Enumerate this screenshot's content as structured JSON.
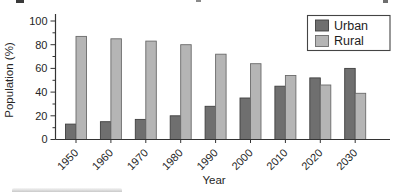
{
  "chart_data": {
    "type": "bar",
    "title": "",
    "categories": [
      "1950",
      "1960",
      "1970",
      "1980",
      "1990",
      "2000",
      "2010",
      "2020",
      "2030"
    ],
    "series": [
      {
        "name": "Urban",
        "values": [
          13,
          15,
          17,
          20,
          28,
          35,
          45,
          52,
          60
        ],
        "fill": "#6f6f6f",
        "stroke": "#3f3f3f"
      },
      {
        "name": "Rural",
        "values": [
          87,
          85,
          83,
          80,
          72,
          64,
          54,
          46,
          39
        ],
        "fill": "#b5b5b5",
        "stroke": "#6a6a6a"
      }
    ],
    "xlabel": "Year",
    "ylabel": "Population (%)",
    "ylim": [
      0,
      100
    ],
    "y_major_step": 20,
    "y_minor_step": 10,
    "y_tick_labels": [
      "0",
      "20",
      "40",
      "60",
      "80",
      "100"
    ],
    "grid": false,
    "legend": {
      "position": "top-right",
      "entries": [
        "Urban",
        "Rural"
      ]
    },
    "axis_color": "#333333",
    "text_color": "#262626",
    "legend_border_color": "#444444",
    "background_color": "#ffffff"
  }
}
